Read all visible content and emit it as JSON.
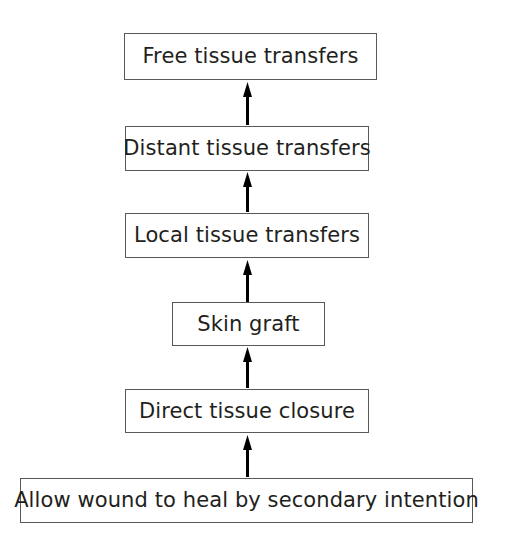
{
  "diagram": {
    "type": "flowchart",
    "orientation": "bottom-to-top",
    "background_color": "#ffffff",
    "box_border_color": "#58595b",
    "text_color": "#231f20",
    "arrow_color": "#000000",
    "nodes": [
      {
        "id": "free",
        "label": "Free tissue transfers",
        "level": 6
      },
      {
        "id": "distant",
        "label": "Distant tissue transfers",
        "level": 5
      },
      {
        "id": "local",
        "label": "Local tissue transfers",
        "level": 4
      },
      {
        "id": "graft",
        "label": "Skin graft",
        "level": 3
      },
      {
        "id": "direct",
        "label": "Direct tissue closure",
        "level": 2
      },
      {
        "id": "secondary",
        "label": "Allow wound to heal by secondary intention",
        "level": 1
      }
    ],
    "arrows": [
      {
        "id": "arrow-secondary-to-direct",
        "from": "secondary",
        "to": "direct",
        "direction": "up"
      },
      {
        "id": "arrow-direct-to-graft",
        "from": "direct",
        "to": "graft",
        "direction": "up"
      },
      {
        "id": "arrow-graft-to-local",
        "from": "graft",
        "to": "local",
        "direction": "up"
      },
      {
        "id": "arrow-local-to-distant",
        "from": "local",
        "to": "distant",
        "direction": "up"
      },
      {
        "id": "arrow-distant-to-free",
        "from": "distant",
        "to": "free",
        "direction": "up"
      }
    ]
  }
}
